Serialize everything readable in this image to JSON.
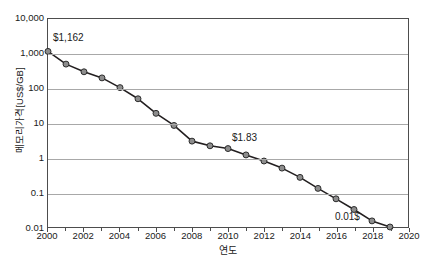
{
  "chart_data": {
    "type": "line",
    "title": "",
    "xlabel": "연도",
    "ylabel": "메모리가격[US$/GB]",
    "yscale": "log",
    "ylim": [
      0.01,
      10000
    ],
    "xlim": [
      2000,
      2020
    ],
    "grid": true,
    "legend": null,
    "ytick_labels": [
      "10,000",
      "1,000",
      "100",
      "10",
      "1",
      "0.1",
      "0.01"
    ],
    "ytick_values": [
      10000,
      1000,
      100,
      10,
      1,
      0.1,
      0.01
    ],
    "xtick_labels": [
      "2000",
      "2002",
      "2004",
      "2006",
      "2008",
      "2010",
      "2012",
      "2014",
      "2016",
      "2018",
      "2020"
    ],
    "xtick_values": [
      2000,
      2002,
      2004,
      2006,
      2008,
      2010,
      2012,
      2014,
      2016,
      2018,
      2020
    ],
    "x": [
      2000,
      2001,
      2002,
      2003,
      2004,
      2005,
      2006,
      2007,
      2008,
      2009,
      2010,
      2011,
      2012,
      2013,
      2014,
      2015,
      2016,
      2017,
      2018,
      2019
    ],
    "values": [
      1162,
      500,
      300,
      200,
      105,
      50,
      19,
      8.5,
      3.0,
      2.2,
      1.83,
      1.2,
      0.8,
      0.5,
      0.27,
      0.13,
      0.065,
      0.032,
      0.015,
      0.01
    ],
    "series": [
      {
        "name": "메모리가격",
        "values": [
          1162,
          500,
          300,
          200,
          105,
          50,
          19,
          8.5,
          3.0,
          2.2,
          1.83,
          1.2,
          0.8,
          0.5,
          0.27,
          0.13,
          0.065,
          0.032,
          0.015,
          0.01
        ],
        "line_color": "#231f20",
        "marker_color": "#8d8d8d"
      }
    ],
    "annotations": [
      {
        "text": "$1,162",
        "x": 2000,
        "y": 1162
      },
      {
        "text": "$1.83",
        "x": 2010,
        "y": 1.83
      },
      {
        "text": "0.01$",
        "x": 2019,
        "y": 0.01
      }
    ]
  },
  "colors": {
    "line": "#231f20",
    "marker_fill": "#8d8d8d",
    "marker_stroke": "#2b2b2b",
    "grid": "#a8a8a8",
    "frame": "#4d4d4d",
    "text": "#1a1a1a",
    "background": "#ffffff"
  }
}
